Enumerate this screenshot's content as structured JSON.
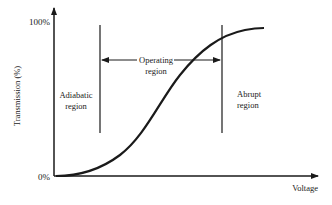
{
  "diagram": {
    "y_axis_label": "Transmission (%)",
    "x_axis_label": "Voltage",
    "y_ticks": [
      "100%",
      "0%"
    ],
    "regions": [
      {
        "name": "adiabatic",
        "line1": "Adiabatic",
        "line2": "region"
      },
      {
        "name": "operating",
        "line1": "Operating",
        "line2": "region"
      },
      {
        "name": "abrupt",
        "line1": "Abrupt",
        "line2": "region"
      }
    ]
  }
}
